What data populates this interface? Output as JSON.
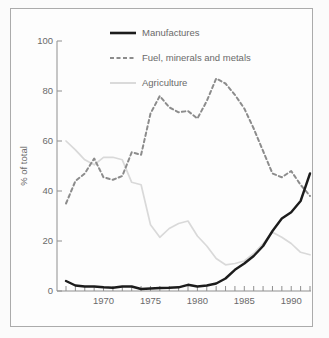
{
  "figure": {
    "border_color": "#ababab",
    "background": "#fdfdfd",
    "text_color": "#6a6a6a",
    "axis_color": "#8f8f8f"
  },
  "chart_data": {
    "type": "line",
    "title": "",
    "xlabel": "",
    "ylabel": "% of total",
    "ylim": [
      0,
      100
    ],
    "yticks": [
      0,
      20,
      40,
      60,
      80,
      100
    ],
    "xtick_labels": [
      1970,
      1975,
      1980,
      1985,
      1990
    ],
    "x_range": [
      1966,
      1992
    ],
    "x": [
      1966,
      1967,
      1968,
      1969,
      1970,
      1971,
      1972,
      1973,
      1974,
      1975,
      1976,
      1977,
      1978,
      1979,
      1980,
      1981,
      1982,
      1983,
      1984,
      1985,
      1986,
      1987,
      1988,
      1989,
      1990,
      1991,
      1992
    ],
    "grid": false,
    "legend_position": "top-inside",
    "series": [
      {
        "name": "Manufactures",
        "style": "solid",
        "color": "#1c1c1c",
        "width": 2.4,
        "values": [
          4,
          2.2,
          1.8,
          1.8,
          1.5,
          1.3,
          1.8,
          1.8,
          0.8,
          1,
          1.2,
          1.3,
          1.5,
          2.5,
          1.8,
          2.2,
          3,
          5,
          8.5,
          11,
          14,
          18,
          24,
          29,
          31.5,
          36,
          47
        ]
      },
      {
        "name": "Fuel, minerals and metals",
        "style": "dashed",
        "color": "#8c8c8c",
        "width": 2,
        "values": [
          35,
          44,
          47,
          53,
          45.5,
          44.5,
          46,
          55.5,
          54.5,
          71,
          78,
          73.5,
          71.5,
          72,
          69,
          76,
          85,
          83,
          78.5,
          73,
          65,
          56,
          47,
          45.5,
          48,
          42.5,
          38
        ]
      },
      {
        "name": "Agriculture",
        "style": "solid",
        "color": "#d9d9d9",
        "width": 1.7,
        "values": [
          60,
          56.5,
          52.5,
          50.5,
          53.5,
          53.5,
          52.5,
          43.5,
          42.5,
          26.5,
          21.5,
          25,
          27,
          28,
          22,
          18,
          13,
          10.5,
          11,
          12,
          15,
          19,
          23.5,
          21.5,
          19,
          15.5,
          14.5
        ]
      }
    ]
  }
}
